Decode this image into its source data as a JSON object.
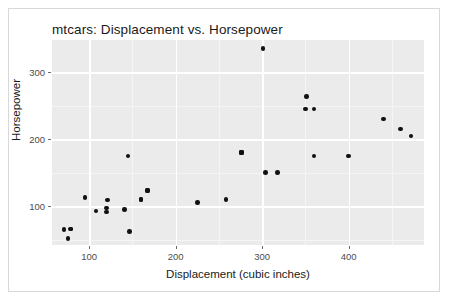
{
  "figure": {
    "width": 450,
    "height": 302,
    "background_color": "#ffffff",
    "border_color": "#d8d8d8",
    "panel_background_color": "#ebebeb",
    "gridline_color": "#ffffff",
    "point_color": "#111111"
  },
  "chart_data": {
    "type": "scatter",
    "title": "mtcars: Displacement vs. Horsepower",
    "xlabel": "Displacement (cubic inches)",
    "ylabel": "Horsepower",
    "xlim": [
      57,
      487
    ],
    "ylim": [
      42,
      348
    ],
    "xticks": [
      100,
      200,
      300,
      400
    ],
    "xtick_labels": [
      "100",
      "200",
      "300",
      "400"
    ],
    "yticks": [
      100,
      200,
      300
    ],
    "ytick_labels": [
      "100",
      "200",
      "300"
    ],
    "x_minor_ticks": [
      150,
      250,
      350,
      450
    ],
    "y_minor_ticks": [
      50,
      150,
      250,
      300
    ],
    "grid": true,
    "legend": false,
    "marker": "filled-circle",
    "marker_size": 4.6,
    "points": [
      {
        "x": 160.0,
        "y": 110
      },
      {
        "x": 160.0,
        "y": 110
      },
      {
        "x": 108.0,
        "y": 93
      },
      {
        "x": 258.0,
        "y": 110
      },
      {
        "x": 360.0,
        "y": 175
      },
      {
        "x": 225.0,
        "y": 105
      },
      {
        "x": 360.0,
        "y": 245
      },
      {
        "x": 146.7,
        "y": 62
      },
      {
        "x": 140.8,
        "y": 95
      },
      {
        "x": 167.6,
        "y": 123
      },
      {
        "x": 167.6,
        "y": 123
      },
      {
        "x": 275.8,
        "y": 180
      },
      {
        "x": 275.8,
        "y": 180
      },
      {
        "x": 275.8,
        "y": 180
      },
      {
        "x": 472.0,
        "y": 205
      },
      {
        "x": 460.0,
        "y": 215
      },
      {
        "x": 440.0,
        "y": 230
      },
      {
        "x": 78.7,
        "y": 66
      },
      {
        "x": 75.7,
        "y": 52
      },
      {
        "x": 71.1,
        "y": 65
      },
      {
        "x": 120.1,
        "y": 97
      },
      {
        "x": 318.0,
        "y": 150
      },
      {
        "x": 304.0,
        "y": 150
      },
      {
        "x": 350.0,
        "y": 245
      },
      {
        "x": 400.0,
        "y": 175
      },
      {
        "x": 79.0,
        "y": 66
      },
      {
        "x": 120.3,
        "y": 91
      },
      {
        "x": 95.1,
        "y": 113
      },
      {
        "x": 351.0,
        "y": 264
      },
      {
        "x": 145.0,
        "y": 175
      },
      {
        "x": 301.0,
        "y": 335
      },
      {
        "x": 121.0,
        "y": 109
      }
    ]
  }
}
